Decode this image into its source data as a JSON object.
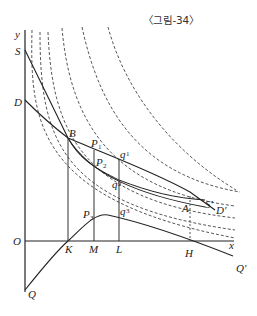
{
  "caption": "〈그림-34〉",
  "axes": {
    "x_label": "x",
    "y_label": "y",
    "origin_label": "O"
  },
  "vertical_axis_labels": {
    "S": "S",
    "D": "D",
    "Q": "Q"
  },
  "points": {
    "B": "B",
    "P1": "P",
    "P1_sub": "1",
    "P2": "P",
    "P2_sub": "2",
    "P3": "P",
    "P3_sub": "3",
    "q1": "q",
    "q1_sub": "1",
    "q2": "q",
    "q2_sub": "2",
    "q3": "q",
    "q3_sub": "3",
    "A": "A"
  },
  "x_axis_points": {
    "K": "K",
    "M": "M",
    "L": "L",
    "H": "H"
  },
  "curve_labels": {
    "S_prime": "S'",
    "D_prime": "D'",
    "Q_prime": "Q'"
  },
  "colors": {
    "line": "#2a2a2a",
    "dashed": "#444444",
    "background": "#ffffff"
  }
}
